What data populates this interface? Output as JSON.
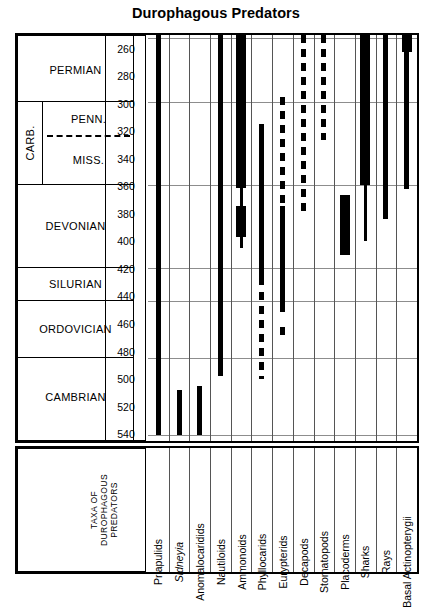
{
  "title": "Durophagous Predators",
  "axis": {
    "unit": "Ma",
    "range": [
      250,
      545
    ],
    "ticks": [
      260,
      280,
      300,
      320,
      340,
      360,
      380,
      400,
      420,
      440,
      460,
      480,
      500,
      520,
      540
    ]
  },
  "timescale": {
    "taxa_block_label": "TAXA OF\nDUROPHAGOUS\nPREDATORS",
    "taxa_block_lines": [
      "TAXA OF",
      "DUROPHAGOUS",
      "PREDATORS"
    ],
    "periods": [
      {
        "name": "PERMIAN",
        "start": 299,
        "end": 252
      },
      {
        "name": "CARB.",
        "start": 359,
        "end": 299,
        "subperiods": [
          {
            "name": "PENN.",
            "start": 323,
            "end": 299
          },
          {
            "name": "MISS.",
            "start": 359,
            "end": 323
          }
        ]
      },
      {
        "name": "DEVONIAN",
        "start": 419,
        "end": 359
      },
      {
        "name": "SILURIAN",
        "start": 443,
        "end": 419
      },
      {
        "name": "ORDOVICIAN",
        "start": 485,
        "end": 443
      },
      {
        "name": "CAMBRIAN",
        "start": 541,
        "end": 485
      }
    ]
  },
  "chart_data": {
    "type": "range-bar",
    "title": "Durophagous Predators",
    "xlabel": "TAXA OF DUROPHAGOUS PREDATORS",
    "ylabel": "Ma",
    "ylim": [
      250,
      545
    ],
    "y_inverted": true,
    "grid": true,
    "legend": null,
    "categories": [
      "Priapulids",
      "Sidneyia",
      "Anomalocaridids",
      "Nautiloids",
      "Ammonoids",
      "Phyllocarids",
      "Eurypterids",
      "Decapods",
      "Stomatopods",
      "Placoderms",
      "Sharks",
      "Rays",
      "Basal Actinopterygii"
    ],
    "series": [
      {
        "name": "Priapulids",
        "italic": false,
        "segments": [
          {
            "from": 250,
            "to": 541,
            "style": "solid",
            "weight": "medium"
          }
        ]
      },
      {
        "name": "Sidneyia",
        "italic": true,
        "segments": [
          {
            "from": 508,
            "to": 541,
            "style": "solid",
            "weight": "medium"
          }
        ]
      },
      {
        "name": "Anomalocaridids",
        "italic": false,
        "segments": [
          {
            "from": 505,
            "to": 541,
            "style": "solid",
            "weight": "medium"
          }
        ]
      },
      {
        "name": "Nautiloids",
        "italic": false,
        "segments": [
          {
            "from": 250,
            "to": 498,
            "style": "solid",
            "weight": "medium"
          }
        ]
      },
      {
        "name": "Ammonoids",
        "italic": false,
        "segments": [
          {
            "from": 250,
            "to": 361,
            "style": "solid",
            "weight": "thick"
          },
          {
            "from": 361,
            "to": 374,
            "style": "solid",
            "weight": "thin"
          },
          {
            "from": 374,
            "to": 397,
            "style": "solid",
            "weight": "thick"
          },
          {
            "from": 397,
            "to": 405,
            "style": "solid",
            "weight": "thin"
          }
        ]
      },
      {
        "name": "Phyllocarids",
        "italic": false,
        "segments": [
          {
            "from": 315,
            "to": 432,
            "style": "solid",
            "weight": "medium"
          },
          {
            "from": 437,
            "to": 500,
            "style": "dashed",
            "weight": "medium"
          }
        ]
      },
      {
        "name": "Eurypterids",
        "italic": false,
        "segments": [
          {
            "from": 295,
            "to": 372,
            "style": "dashed",
            "weight": "medium"
          },
          {
            "from": 374,
            "to": 451,
            "style": "solid",
            "weight": "medium"
          },
          {
            "from": 462,
            "to": 470,
            "style": "dashed",
            "weight": "medium"
          }
        ]
      },
      {
        "name": "Decapods",
        "italic": false,
        "segments": [
          {
            "from": 250,
            "to": 380,
            "style": "dashed",
            "weight": "medium"
          }
        ]
      },
      {
        "name": "Stomatopods",
        "italic": false,
        "segments": [
          {
            "from": 250,
            "to": 326,
            "style": "dashed",
            "weight": "medium"
          }
        ]
      },
      {
        "name": "Placoderms",
        "italic": false,
        "segments": [
          {
            "from": 366,
            "to": 410,
            "style": "solid",
            "weight": "thick"
          }
        ]
      },
      {
        "name": "Sharks",
        "italic": false,
        "segments": [
          {
            "from": 250,
            "to": 359,
            "style": "solid",
            "weight": "thick"
          },
          {
            "from": 359,
            "to": 400,
            "style": "solid",
            "weight": "thin"
          }
        ]
      },
      {
        "name": "Rays",
        "italic": false,
        "segments": [
          {
            "from": 250,
            "to": 384,
            "style": "solid",
            "weight": "medium"
          }
        ]
      },
      {
        "name": "Basal Actinopterygii",
        "italic": false,
        "segments": [
          {
            "from": 250,
            "to": 262,
            "style": "solid",
            "weight": "thick"
          },
          {
            "from": 262,
            "to": 362,
            "style": "solid",
            "weight": "medium"
          }
        ]
      }
    ]
  }
}
